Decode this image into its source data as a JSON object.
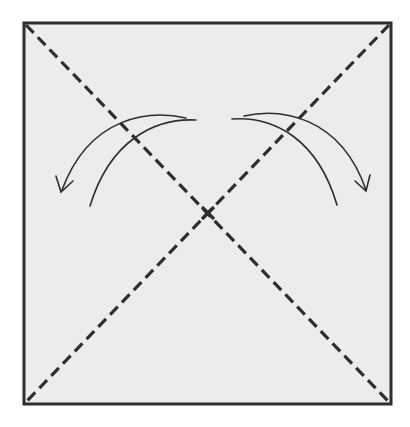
{
  "diagram": {
    "type": "origami-fold-step",
    "colors": {
      "background": "#ffffff",
      "paper_fill": "#ececec",
      "stroke": "#2e2e2e"
    },
    "square": {
      "x": 24,
      "y": 23,
      "width": 367,
      "height": 381
    },
    "fold_lines": [
      {
        "name": "diagonal-top-left-to-bottom-right",
        "style": "dashed",
        "x1": 24,
        "y1": 23,
        "x2": 391,
        "y2": 404
      },
      {
        "name": "diagonal-top-right-to-bottom-left",
        "style": "dashed",
        "x1": 391,
        "y1": 23,
        "x2": 24,
        "y2": 404
      }
    ],
    "arrows": [
      {
        "name": "left-fold-arrow",
        "direction": "down-left"
      },
      {
        "name": "right-fold-arrow",
        "direction": "down-right"
      }
    ]
  }
}
